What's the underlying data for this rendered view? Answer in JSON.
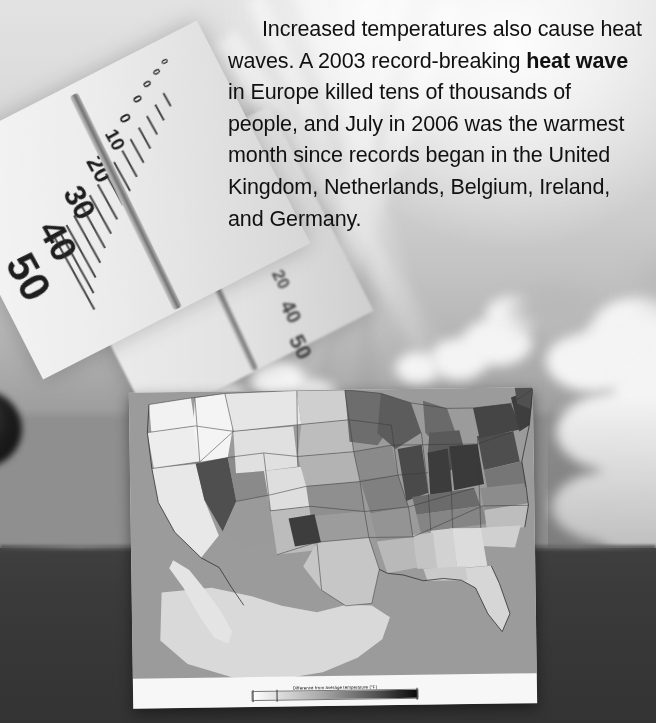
{
  "page": {
    "width": 656,
    "height": 723,
    "kind": "textbook-page-spread"
  },
  "body_text": {
    "paragraph": "Increased temperatures also cause heat waves. A 2003 record-breaking ",
    "bold_phrase": "heat wave",
    "paragraph_rest": " in Europe killed tens of thousands of people, and July in 2006 was the warmest month since records began in the United Kingdom, Netherlands, Belgium, Ireland, and Germany.",
    "full_text": "Increased temperatures also cause heat waves. A 2003 record-breaking heat wave in Europe killed tens of thousands of people, and July in 2006 was the warmest month since records began in the United Kingdom, Netherlands, Belgium, Ireland, and Germany.",
    "lines": [
      "Increased temperatures also",
      "cause heat waves. A 2003 record-",
      "breaking heat wave in Europe",
      "killed tens of thousands of people,",
      "and July in 2006 was the warmest",
      "month since records began in the",
      "United Kingdom, Netherlands,",
      "Belgium, Ireland, and Germany."
    ]
  },
  "photo": {
    "subject": "thermometer-against-sky-with-sun-rays-and-clouds",
    "thermometer": {
      "left_scale_label": "Celsius",
      "left_scale_values": [
        "50",
        "40",
        "30",
        "20",
        "10",
        "0"
      ],
      "right_scale_label": "Fahrenheit",
      "right_scale_values": [
        "20",
        "0",
        "20",
        "40",
        "50"
      ],
      "bulb": "mercury-bulb"
    },
    "sky_top_color": "#e2e2e2",
    "horizon_color": "#8f8f8f",
    "ground_color": "#3a3a3a"
  },
  "map_card": {
    "title": "US temperature anomaly map",
    "legend_title": "Difference from average temperature (°F)",
    "ocean_color": "#9b9b9b",
    "panel_color": "#f7f7f7",
    "legend_gradient_stops": [
      "#ffffff",
      "#c9c9c9",
      "#7e7e7e",
      "#2b2b2b",
      "#0a0a0a"
    ],
    "regions": [
      {
        "name": "Pacific Northwest",
        "shade": "#f0f0f0"
      },
      {
        "name": "California",
        "shade": "#ededed"
      },
      {
        "name": "Great Basin",
        "shade": "#cfcfcf"
      },
      {
        "name": "Nevada-Arizona hotspot",
        "shade": "#4a4a4a"
      },
      {
        "name": "Northern Rockies",
        "shade": "#e3e3e3"
      },
      {
        "name": "Northern Plains",
        "shade": "#dcdcdc"
      },
      {
        "name": "Central Plains",
        "shade": "#9f9f9f"
      },
      {
        "name": "Southwest Texas anomaly",
        "shade": "#3d3d3d"
      },
      {
        "name": "Upper Midwest",
        "shade": "#6f6f6f"
      },
      {
        "name": "Great Lakes",
        "shade": "#5a5a5a"
      },
      {
        "name": "Ohio Valley",
        "shade": "#3a3a3a"
      },
      {
        "name": "Northeast",
        "shade": "#4d4d4d"
      },
      {
        "name": "Mid-Atlantic",
        "shade": "#777777"
      },
      {
        "name": "Southeast",
        "shade": "#dcdcdc"
      },
      {
        "name": "Gulf Coast",
        "shade": "#bdbdbd"
      },
      {
        "name": "Florida",
        "shade": "#d4d4d4"
      },
      {
        "name": "South Texas",
        "shade": "#e0e0e0"
      }
    ]
  }
}
